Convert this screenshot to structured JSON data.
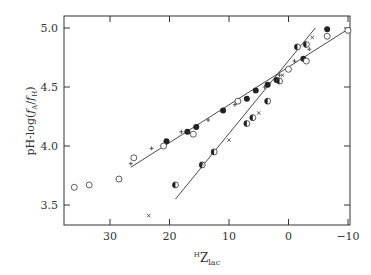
{
  "chart_data": {
    "type": "scatter",
    "title": "",
    "xlabel": "H Z lac",
    "xlabel_parts": {
      "superscript": "H",
      "main": "Z",
      "subscript": "lac"
    },
    "ylabel": "pH-log(fA/fH)",
    "ylabel_parts": {
      "prefix": "pH-log",
      "num": "f",
      "num_sub": "A",
      "den": "f",
      "den_sub": "H"
    },
    "xlim": [
      38,
      -11
    ],
    "ylim": [
      3.35,
      5.1
    ],
    "x_reversed": true,
    "x_ticks": [
      30,
      20,
      10,
      0,
      -10
    ],
    "x_tick_labels": [
      "30",
      "20",
      "10",
      "0",
      "−10"
    ],
    "y_ticks": [
      3.5,
      4.0,
      4.5,
      5.0
    ],
    "y_tick_labels": [
      "3.5",
      "4.0",
      "4.5",
      "5.0"
    ],
    "grid": false,
    "legend": null,
    "series": [
      {
        "name": "filled circles",
        "marker": "filled-circle",
        "points": [
          [
            20.5,
            4.04
          ],
          [
            17,
            4.12
          ],
          [
            15.5,
            4.16
          ],
          [
            11,
            4.3
          ],
          [
            7,
            4.4
          ],
          [
            5.5,
            4.47
          ],
          [
            3.5,
            4.52
          ],
          [
            2,
            4.56
          ],
          [
            -2.5,
            4.74
          ],
          [
            -6.5,
            4.99
          ]
        ]
      },
      {
        "name": "open circles",
        "marker": "open-circle",
        "points": [
          [
            36,
            3.65
          ],
          [
            33.5,
            3.67
          ],
          [
            28.5,
            3.72
          ],
          [
            26,
            3.9
          ],
          [
            21,
            4.0
          ],
          [
            16,
            4.1
          ],
          [
            8.5,
            4.38
          ],
          [
            0,
            4.65
          ],
          [
            -3,
            4.72
          ],
          [
            -6.5,
            4.93
          ],
          [
            -10,
            4.98
          ]
        ]
      },
      {
        "name": "half-filled circles",
        "marker": "half-circle",
        "points": [
          [
            19,
            3.67
          ],
          [
            14.5,
            3.84
          ],
          [
            12.5,
            3.95
          ],
          [
            7,
            4.19
          ],
          [
            6,
            4.24
          ],
          [
            3.5,
            4.38
          ],
          [
            1.5,
            4.55
          ],
          [
            -1.5,
            4.84
          ],
          [
            -3,
            4.86
          ]
        ]
      },
      {
        "name": "plus",
        "marker": "plus",
        "points": [
          [
            26.5,
            3.85
          ],
          [
            23,
            3.98
          ],
          [
            18,
            4.12
          ],
          [
            13.5,
            4.22
          ],
          [
            9,
            4.35
          ],
          [
            4,
            4.5
          ],
          [
            1.5,
            4.6
          ],
          [
            -1,
            4.72
          ],
          [
            -3.5,
            4.82
          ]
        ]
      },
      {
        "name": "cross",
        "marker": "cross",
        "points": [
          [
            23.5,
            3.41
          ],
          [
            14.5,
            3.85
          ],
          [
            10,
            4.05
          ],
          [
            5,
            4.28
          ],
          [
            1,
            4.6
          ],
          [
            -4,
            4.92
          ]
        ]
      }
    ],
    "fit_lines": [
      {
        "name": "shallow line",
        "x": [
          26.5,
          -10
        ],
        "y": [
          3.82,
          4.99
        ]
      },
      {
        "name": "steep line",
        "x": [
          19,
          -4.5
        ],
        "y": [
          3.55,
          5.0
        ]
      }
    ]
  }
}
